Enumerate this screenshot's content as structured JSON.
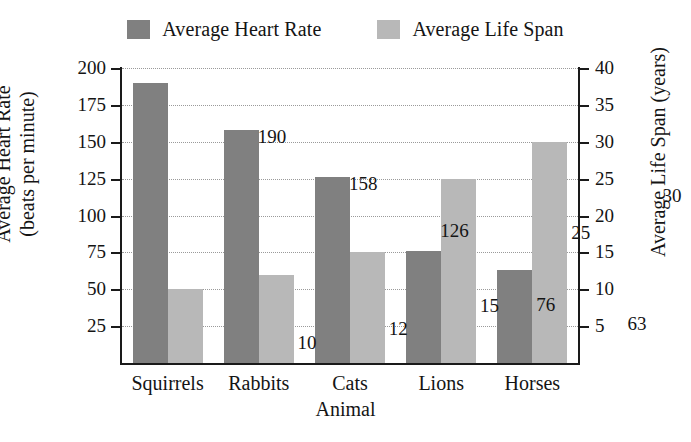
{
  "chart_data": {
    "type": "bar",
    "title": "",
    "categories": [
      "Squirrels",
      "Rabbits",
      "Cats",
      "Lions",
      "Horses"
    ],
    "series": [
      {
        "name": "Average Heart Rate",
        "axis": "left",
        "color": "#808080",
        "values": [
          190,
          158,
          126,
          76,
          63
        ],
        "labels": [
          "190",
          "158",
          "126",
          "76",
          "63"
        ]
      },
      {
        "name": "Average Life Span",
        "axis": "right",
        "color": "#b8b8b8",
        "values": [
          10,
          12,
          15,
          25,
          30
        ],
        "labels": [
          "10",
          "12",
          "15",
          "25",
          "30"
        ]
      }
    ],
    "xlabel": "Animal",
    "ylabel_left_line1": "Average Heart Rate",
    "ylabel_left_line2": "(beats per minute)",
    "ylabel_right": "Average Life Span (years)",
    "ylim_left": [
      0,
      200
    ],
    "ylim_right": [
      0,
      40
    ],
    "yticks_left": [
      "200",
      "175",
      "150",
      "125",
      "100",
      "75",
      "50",
      "25"
    ],
    "yticks_right": [
      "40",
      "35",
      "30",
      "25",
      "20",
      "15",
      "10",
      "5"
    ],
    "ytick_values_left": [
      200,
      175,
      150,
      125,
      100,
      75,
      50,
      25
    ],
    "ytick_values_right": [
      40,
      35,
      30,
      25,
      20,
      15,
      10,
      5
    ],
    "grid": true,
    "grid_style": "dotted",
    "legend_position": "top-center"
  },
  "legend": {
    "entries": [
      {
        "label": "Average Heart Rate",
        "color": "#808080"
      },
      {
        "label": "Average Life Span",
        "color": "#b8b8b8"
      }
    ]
  }
}
